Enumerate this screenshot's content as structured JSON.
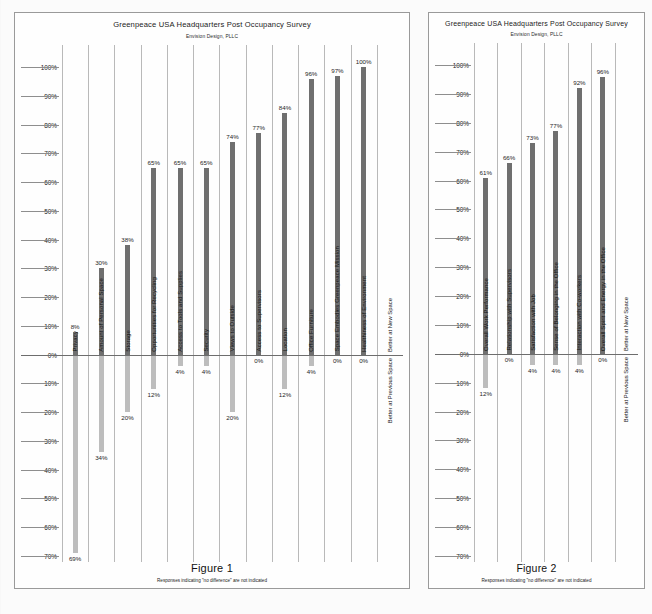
{
  "figures": [
    {
      "id": "figure-1",
      "title": "Greenpeace USA Headquarters Post Occupancy Survey",
      "subtitle": "Envision Design, PLLC",
      "figure_label": "Figure 1",
      "footnote": "Responses indicating \"no difference\" are not indicated",
      "upper_axis_label": "Better at New Space",
      "lower_axis_label": "Better at Previous Space",
      "chart_data": {
        "type": "bar",
        "title": "Greenpeace USA Headquarters Post Occupancy Survey",
        "subtitle": "Envision Design, PLLC",
        "xlabel": "",
        "ylabel": "",
        "ylim": [
          -70,
          100
        ],
        "grid": true,
        "legend": false,
        "y_ticks_upper": [
          "0%",
          "10%",
          "20%",
          "30%",
          "40%",
          "50%",
          "60%",
          "70%",
          "80%",
          "90%",
          "100%"
        ],
        "y_ticks_lower": [
          "10%",
          "20%",
          "30%",
          "40%",
          "50%",
          "60%",
          "70%"
        ],
        "categories": [
          "Privacy",
          "Amount of Personal Space",
          "Storage",
          "Opportunities for Recycling",
          "Access to Tools and Supplies",
          "Security",
          "Views to Outside",
          "Access to Supervisors",
          "Location",
          "Office Furniture",
          "Space Embodies Greenpeace Mission",
          "Healthiness of Environment"
        ],
        "series": [
          {
            "name": "Better at New Space",
            "values": [
              8,
              30,
              38,
              65,
              65,
              65,
              74,
              77,
              84,
              96,
              97,
              100
            ],
            "labels": [
              "8%",
              "30%",
              "38%",
              "65%",
              "65%",
              "65%",
              "74%",
              "77%",
              "84%",
              "96%",
              "97%",
              "100%"
            ]
          },
          {
            "name": "Better at Previous Space",
            "values": [
              69,
              34,
              20,
              12,
              4,
              4,
              20,
              0,
              12,
              4,
              0,
              0
            ],
            "labels": [
              "69%",
              "34%",
              "20%",
              "12%",
              "4%",
              "4%",
              "20%",
              "0%",
              "12%",
              "4%",
              "0%",
              "0%"
            ]
          }
        ]
      }
    },
    {
      "id": "figure-2",
      "title": "Greenpeace USA Headquarters Post Occupancy Survey",
      "subtitle": "Envision Design, PLLC",
      "figure_label": "Figure 2",
      "footnote": "Responses indicating \"no difference\" are not indicated",
      "upper_axis_label": "Better at New Space",
      "lower_axis_label": "Better at Previous Space",
      "chart_data": {
        "type": "bar",
        "title": "Greenpeace USA Headquarters Post Occupancy Survey",
        "subtitle": "Envision Design, PLLC",
        "xlabel": "",
        "ylabel": "",
        "ylim": [
          -70,
          100
        ],
        "grid": true,
        "legend": false,
        "y_ticks_upper": [
          "0%",
          "10%",
          "20%",
          "30%",
          "40%",
          "50%",
          "60%",
          "70%",
          "80%",
          "90%",
          "100%"
        ],
        "y_ticks_lower": [
          "10%",
          "20%",
          "30%",
          "40%",
          "50%",
          "60%",
          "70%"
        ],
        "categories": [
          "Overall Work Performance",
          "Relationship with Supervisors",
          "Satisfaction with Job",
          "Sense of Belonging in the Office",
          "Interaction with Co-workers",
          "Overall Spirit and Energy in the Office"
        ],
        "series": [
          {
            "name": "Better at New Space",
            "values": [
              61,
              66,
              73,
              77,
              92,
              96
            ],
            "labels": [
              "61%",
              "66%",
              "73%",
              "77%",
              "92%",
              "96%"
            ]
          },
          {
            "name": "Better at Previous Space",
            "values": [
              12,
              0,
              4,
              4,
              4,
              0
            ],
            "labels": [
              "12%",
              "0%",
              "4%",
              "4%",
              "4%",
              "0%"
            ]
          }
        ]
      }
    }
  ]
}
